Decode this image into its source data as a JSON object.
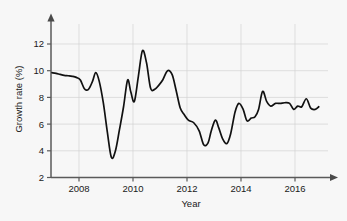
{
  "chart_data": {
    "type": "line",
    "title": "",
    "xlabel": "Year",
    "ylabel": "Growth rate (%)",
    "xlim": [
      2007.0,
      2016.9
    ],
    "ylim": [
      2,
      13.2
    ],
    "xticks": [
      2008,
      2010,
      2012,
      2014,
      2016
    ],
    "xtick_labels": [
      "2008",
      "2010",
      "2012",
      "2014",
      "2016"
    ],
    "yticks": [
      2,
      4,
      6,
      8,
      10,
      12
    ],
    "ytick_labels": [
      "2",
      "4",
      "6",
      "8",
      "10",
      "12"
    ],
    "grid": true,
    "legend": null,
    "series": [
      {
        "name": "Growth rate",
        "color": "#111111",
        "x": [
          2007.0,
          2007.15,
          2007.3,
          2007.45,
          2007.6,
          2007.75,
          2007.9,
          2008.05,
          2008.2,
          2008.35,
          2008.5,
          2008.62,
          2008.75,
          2008.9,
          2009.05,
          2009.2,
          2009.35,
          2009.5,
          2009.65,
          2009.8,
          2009.92,
          2010.05,
          2010.2,
          2010.35,
          2010.5,
          2010.65,
          2010.8,
          2010.95,
          2011.1,
          2011.28,
          2011.45,
          2011.6,
          2011.75,
          2011.9,
          2012.05,
          2012.25,
          2012.45,
          2012.62,
          2012.78,
          2012.9,
          2013.05,
          2013.18,
          2013.32,
          2013.48,
          2013.62,
          2013.78,
          2013.92,
          2014.08,
          2014.22,
          2014.38,
          2014.52,
          2014.65,
          2014.8,
          2014.95,
          2015.1,
          2015.28,
          2015.45,
          2015.62,
          2015.8,
          2015.95,
          2016.1,
          2016.25,
          2016.42,
          2016.58,
          2016.75,
          2016.88
        ],
        "y": [
          9.85,
          9.8,
          9.72,
          9.65,
          9.62,
          9.58,
          9.5,
          9.3,
          8.65,
          8.6,
          9.2,
          9.85,
          9.2,
          7.6,
          5.4,
          3.5,
          4.0,
          5.6,
          7.3,
          9.3,
          8.4,
          7.7,
          9.6,
          11.5,
          10.6,
          8.7,
          8.6,
          8.9,
          9.3,
          10.0,
          9.7,
          8.5,
          7.2,
          6.7,
          6.3,
          6.1,
          5.5,
          4.45,
          4.6,
          5.5,
          6.3,
          5.7,
          4.9,
          4.55,
          5.3,
          6.9,
          7.55,
          7.1,
          6.25,
          6.45,
          6.55,
          7.1,
          8.45,
          7.7,
          7.35,
          7.55,
          7.55,
          7.6,
          7.55,
          7.1,
          7.35,
          7.3,
          7.9,
          7.2,
          7.1,
          7.3
        ]
      }
    ]
  },
  "axes": {
    "x_arrow_icon": "arrow-right-icon",
    "y_arrow_icon": "arrow-up-icon"
  }
}
